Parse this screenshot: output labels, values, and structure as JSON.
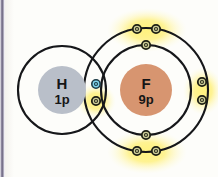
{
  "figure": {
    "type": "covalent-bond-shell-diagram",
    "title_visible": false,
    "background_color": "#fdfdfa",
    "shell_line_color": "#16171a",
    "highlight_color": "#ffe94d",
    "bond_electron_color": "#7fd4ec"
  },
  "atoms": [
    {
      "id": "hydrogen",
      "symbol": "H",
      "nucleus_label": "1p",
      "nucleus_color": "#b9bfc9",
      "center": {
        "x": 62,
        "y": 90
      },
      "nucleus_radius": 24,
      "shells": [
        {
          "radius": 44
        }
      ]
    },
    {
      "id": "fluorine",
      "symbol": "F",
      "nucleus_label": "9p",
      "nucleus_color": "#d79570",
      "center": {
        "x": 146,
        "y": 90
      },
      "nucleus_radius": 26,
      "shells": [
        {
          "radius": 45
        },
        {
          "radius": 62
        }
      ]
    }
  ],
  "electrons": [
    {
      "id": "f-inner-top",
      "atom": "fluorine",
      "shell": "inner",
      "x": 146,
      "y": 45,
      "color": "#cfcf9a",
      "highlighted": false
    },
    {
      "id": "f-inner-bottom",
      "atom": "fluorine",
      "shell": "inner",
      "x": 146,
      "y": 135,
      "color": "#cfcf9a",
      "highlighted": false
    },
    {
      "id": "f-outer-top-1",
      "atom": "fluorine",
      "shell": "outer",
      "x": 137,
      "y": 29,
      "color": "#cfcf9a",
      "highlighted": true
    },
    {
      "id": "f-outer-top-2",
      "atom": "fluorine",
      "shell": "outer",
      "x": 156,
      "y": 29,
      "color": "#cfcf9a",
      "highlighted": true
    },
    {
      "id": "f-outer-bottom-1",
      "atom": "fluorine",
      "shell": "outer",
      "x": 137,
      "y": 151,
      "color": "#cfcf9a",
      "highlighted": true
    },
    {
      "id": "f-outer-bottom-2",
      "atom": "fluorine",
      "shell": "outer",
      "x": 156,
      "y": 151,
      "color": "#cfcf9a",
      "highlighted": true
    },
    {
      "id": "f-outer-right-1",
      "atom": "fluorine",
      "shell": "outer",
      "x": 202,
      "y": 82,
      "color": "#cfcf9a",
      "highlighted": true
    },
    {
      "id": "f-outer-right-2",
      "atom": "fluorine",
      "shell": "outer",
      "x": 202,
      "y": 100,
      "color": "#cfcf9a",
      "highlighted": true
    },
    {
      "id": "bond-electron-h",
      "atom": "hydrogen",
      "shell": "bond",
      "x": 96,
      "y": 84,
      "color": "#7fd4ec",
      "highlighted": false
    },
    {
      "id": "bond-electron-f",
      "atom": "fluorine",
      "shell": "bond",
      "x": 96,
      "y": 101,
      "color": "#cfcf9a",
      "highlighted": true
    }
  ],
  "glow_spots": [
    {
      "id": "glow-top",
      "x": 147,
      "y": 30,
      "rx": 40,
      "ry": 22
    },
    {
      "id": "glow-bottom",
      "x": 147,
      "y": 152,
      "rx": 40,
      "ry": 22
    },
    {
      "id": "glow-right",
      "x": 203,
      "y": 91,
      "rx": 20,
      "ry": 24
    },
    {
      "id": "glow-bond",
      "x": 96,
      "y": 101,
      "rx": 20,
      "ry": 18
    }
  ],
  "counts": {
    "hydrogen_protons": "1p",
    "fluorine_protons": "9p",
    "fluorine_inner_electrons": 2,
    "fluorine_outer_lone_electrons": 6,
    "shared_electrons": 2
  }
}
